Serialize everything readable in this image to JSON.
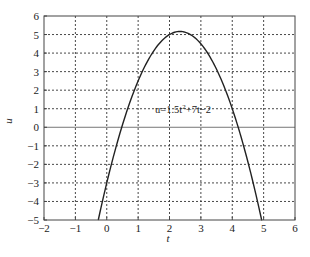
{
  "chart_data": {
    "type": "line",
    "title": "",
    "xlabel": "t",
    "ylabel": "u",
    "xlim": [
      -2,
      6
    ],
    "ylim": [
      -5,
      6
    ],
    "xticks": [
      -2,
      -1,
      0,
      1,
      2,
      3,
      4,
      5,
      6
    ],
    "yticks": [
      -5,
      -4,
      -3,
      -2,
      -1,
      0,
      1,
      2,
      3,
      4,
      5,
      6
    ],
    "grid": true,
    "legend": null,
    "annotations": [
      {
        "text_prefix": "u=1.5t",
        "superscript": "2",
        "text_suffix": "+7t−2",
        "x": 1.45,
        "y": 0.55
      }
    ],
    "series": [
      {
        "name": "u(t)",
        "color": "#222222",
        "coefficients_observed": {
          "a": -1.5,
          "b": 7,
          "c": -3
        },
        "x": [
          -0.27,
          0,
          0.25,
          0.5,
          0.75,
          1,
          1.25,
          1.5,
          1.75,
          2,
          2.25,
          2.33,
          2.5,
          2.75,
          3,
          3.25,
          3.5,
          3.75,
          4,
          4.25,
          4.5,
          4.75,
          4.94
        ],
        "values": [
          -5.0,
          -3.0,
          -1.34,
          0.13,
          1.41,
          2.5,
          3.41,
          4.13,
          4.66,
          5.0,
          5.16,
          5.17,
          5.13,
          4.91,
          4.5,
          3.91,
          3.13,
          2.16,
          1.0,
          -0.34,
          -1.88,
          -3.59,
          -5.0
        ]
      }
    ]
  },
  "axes": {
    "x_tick_labels": [
      "−2",
      "−1",
      "0",
      "1",
      "2",
      "3",
      "4",
      "5",
      "6"
    ],
    "y_tick_labels": [
      "−5",
      "−4",
      "−3",
      "−2",
      "−1",
      "0",
      "1",
      "2",
      "3",
      "4",
      "5",
      "6"
    ],
    "xlabel": "t",
    "ylabel": "u"
  },
  "annotation": {
    "prefix": "u=1.5t",
    "sup": "2",
    "suffix": "+7t−2"
  }
}
